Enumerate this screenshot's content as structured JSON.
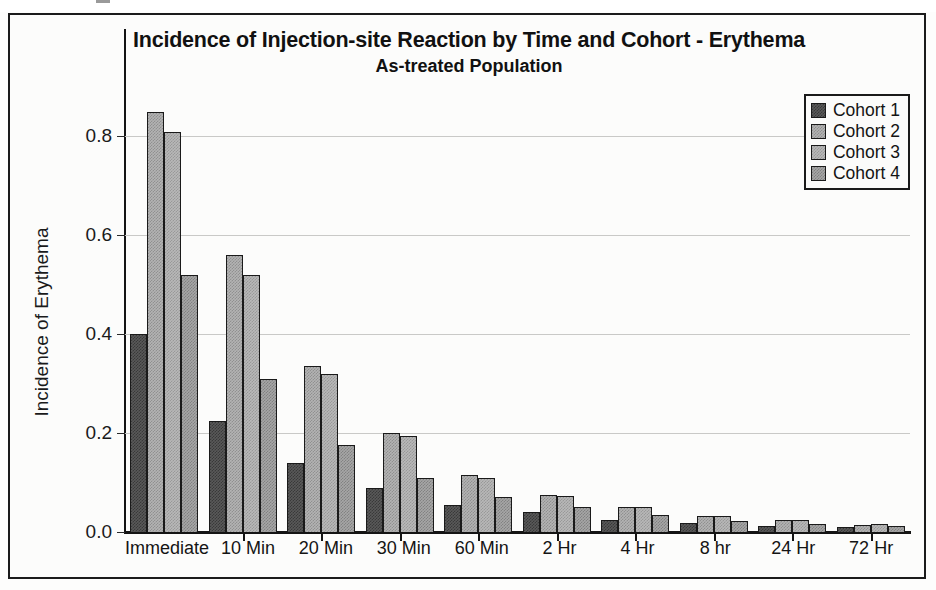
{
  "chart_data": {
    "type": "bar",
    "title": "Incidence of Injection-site Reaction by Time and Cohort - Erythema",
    "subtitle": "As-treated Population",
    "xlabel": "",
    "ylabel": "Incidence of Erythema",
    "ylim": [
      0.0,
      0.9
    ],
    "yticks": [
      0.0,
      0.2,
      0.4,
      0.6,
      0.8
    ],
    "ytick_labels": [
      "0.0",
      "0.2",
      "0.4",
      "0.6",
      "0.8"
    ],
    "grid": true,
    "legend_position": "top-right",
    "categories": [
      "Immediate",
      "10 Min",
      "20 Min",
      "30 Min",
      "60 Min",
      "2 Hr",
      "4 Hr",
      "8 hr",
      "24 Hr",
      "72 Hr"
    ],
    "series": [
      {
        "name": "Cohort 1",
        "color": "#595959",
        "values": [
          0.4,
          0.225,
          0.14,
          0.09,
          0.055,
          0.04,
          0.025,
          0.018,
          0.012,
          0.01
        ]
      },
      {
        "name": "Cohort 2",
        "color": "#b3b3b3",
        "values": [
          0.85,
          0.56,
          0.335,
          0.2,
          0.115,
          0.075,
          0.05,
          0.033,
          0.024,
          0.015
        ]
      },
      {
        "name": "Cohort 3",
        "color": "#b8b8b8",
        "values": [
          0.81,
          0.52,
          0.32,
          0.195,
          0.11,
          0.073,
          0.05,
          0.032,
          0.024,
          0.016
        ]
      },
      {
        "name": "Cohort 4",
        "color": "#a6a6a6",
        "values": [
          0.52,
          0.31,
          0.175,
          0.11,
          0.07,
          0.05,
          0.035,
          0.022,
          0.016,
          0.012
        ]
      }
    ]
  },
  "legend": {
    "entries": [
      {
        "label": "Cohort 1"
      },
      {
        "label": "Cohort 2"
      },
      {
        "label": "Cohort 3"
      },
      {
        "label": "Cohort 4"
      }
    ]
  }
}
